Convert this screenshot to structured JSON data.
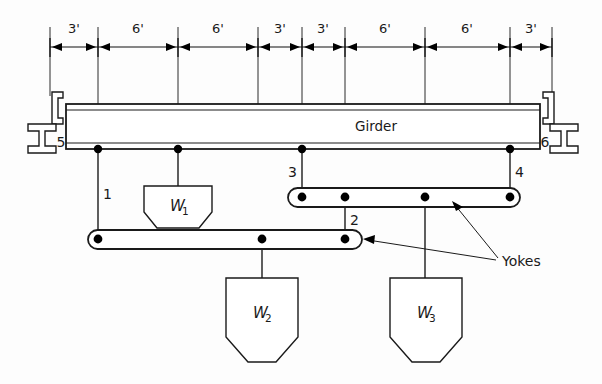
{
  "figure": {
    "title_text": "Girder",
    "yokes_label": "Yokes",
    "background_color": "#fdfdfd",
    "line_color": "#1a1a1a"
  },
  "dimensions": {
    "unit_symbol": "'",
    "segments": [
      {
        "label": "3'",
        "value": 3,
        "x_start": 50,
        "x_end": 98
      },
      {
        "label": "6'",
        "value": 6,
        "x_start": 98,
        "x_end": 178
      },
      {
        "label": "6'",
        "value": 6,
        "x_start": 178,
        "x_end": 258
      },
      {
        "label": "3'",
        "value": 3,
        "x_start": 258,
        "x_end": 302
      },
      {
        "label": "3'",
        "value": 3,
        "x_start": 302,
        "x_end": 345
      },
      {
        "label": "6'",
        "value": 6,
        "x_start": 345,
        "x_end": 425
      },
      {
        "label": "6'",
        "value": 6,
        "x_start": 425,
        "x_end": 510
      },
      {
        "label": "3'",
        "value": 3,
        "x_start": 510,
        "x_end": 552
      }
    ],
    "total_span_label": "36'",
    "total_span_value": 36
  },
  "supports": {
    "left": {
      "label": "5",
      "type": "i-beam-hanger"
    },
    "right": {
      "label": "6",
      "type": "i-beam-hanger"
    }
  },
  "points": [
    {
      "label": "1",
      "x": 98,
      "on": "girder"
    },
    {
      "label": "2",
      "x": 345,
      "on": "upper-yoke"
    },
    {
      "label": "3",
      "x": 302,
      "on": "girder"
    },
    {
      "label": "4",
      "x": 510,
      "on": "girder"
    }
  ],
  "yokes": [
    {
      "name": "upper-right-yoke",
      "x_start": 288,
      "x_end": 520,
      "y": 197,
      "dots_x": [
        302,
        345,
        425,
        510
      ]
    },
    {
      "name": "lower-left-yoke",
      "x_start": 88,
      "x_end": 362,
      "y": 239,
      "dots_x": [
        98,
        262,
        345
      ]
    }
  ],
  "loads": [
    {
      "name": "W1",
      "label": "W",
      "subscript": "1",
      "hanger_x": 178,
      "top_y": 180
    },
    {
      "name": "W2",
      "label": "W",
      "subscript": "2",
      "hanger_x": 262,
      "top_y": 272
    },
    {
      "name": "W3",
      "label": "W",
      "subscript": "3",
      "hanger_x": 425,
      "top_y": 272
    }
  ],
  "girder": {
    "x_left": 66,
    "x_right": 540,
    "y_top": 104,
    "y_bottom": 149,
    "label": "Girder"
  }
}
